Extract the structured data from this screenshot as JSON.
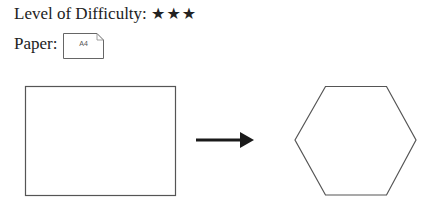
{
  "difficulty": {
    "label": "Level of Difficulty:",
    "stars": "★★★",
    "rating": 3
  },
  "paper": {
    "label": "Paper:",
    "size": "A4",
    "icon": "paper-sheet-icon"
  },
  "diagram": {
    "from_shape": "rectangle",
    "arrow": "right-arrow-icon",
    "to_shape": "hexagon",
    "stroke_color": "#555555",
    "arrow_color": "#1a1a1a"
  }
}
